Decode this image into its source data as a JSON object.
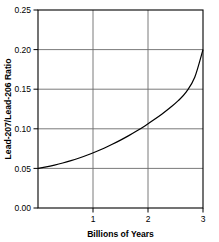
{
  "chart_data": {
    "type": "line",
    "title": "",
    "xlabel": "Billions of Years",
    "ylabel": "Lead-207/Lead-206 Ratio",
    "xlim": [
      0,
      3
    ],
    "ylim": [
      0.0,
      0.25
    ],
    "grid": true,
    "legend": null,
    "xticks": [
      1,
      2,
      3
    ],
    "xtick_labels": [
      "1",
      "2",
      "3"
    ],
    "yticks": [
      0.0,
      0.05,
      0.1,
      0.15,
      0.2,
      0.25
    ],
    "ytick_labels": [
      "0.00",
      "0.05",
      "0.10",
      "0.15",
      "0.20",
      "0.25"
    ],
    "series": [
      {
        "name": "Lead-207/Lead-206 Ratio",
        "color": "#000000",
        "x": [
          0.0,
          0.15,
          0.3,
          0.45,
          0.6,
          0.75,
          0.9,
          1.05,
          1.2,
          1.35,
          1.5,
          1.65,
          1.8,
          1.95,
          2.1,
          2.25,
          2.4,
          2.55,
          2.7,
          2.85,
          3.0
        ],
        "values": [
          0.05,
          0.0519,
          0.0542,
          0.0568,
          0.0598,
          0.0632,
          0.0669,
          0.071,
          0.0755,
          0.0804,
          0.0857,
          0.0914,
          0.0975,
          0.104,
          0.111,
          0.1184,
          0.1265,
          0.1355,
          0.147,
          0.165,
          0.2
        ]
      }
    ]
  },
  "axes": {
    "x_title": "Billions of Years",
    "y_title": "Lead-207/Lead-206 Ratio"
  },
  "ticks": {
    "y": [
      "0.25",
      "0.20",
      "0.15",
      "0.10",
      "0.05",
      "0.00"
    ],
    "x": [
      "1",
      "2",
      "3"
    ]
  }
}
